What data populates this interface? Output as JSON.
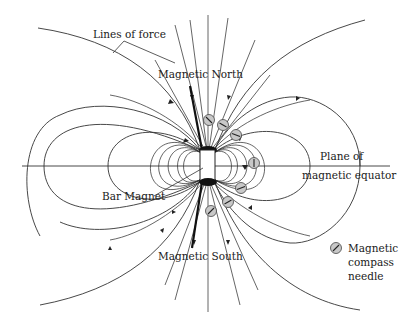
{
  "figure": {
    "type": "magnetic field diagram",
    "labels": {
      "lines_of_force": "Lines of force",
      "magnetic_north": "Magnetic North",
      "magnetic_south": "Magnetic South",
      "bar_magnet": "Bar Magnet",
      "plane_line1": "Plane of",
      "plane_line2": "magnetic equator",
      "legend_line1": "Magnetic",
      "legend_line2": "compass",
      "legend_line3": "needle"
    },
    "colors": {
      "line": "#333333",
      "compass_fill": "#c8c8c8",
      "pole": "#111111",
      "background": "#ffffff"
    },
    "compass_needle_count": 7
  }
}
